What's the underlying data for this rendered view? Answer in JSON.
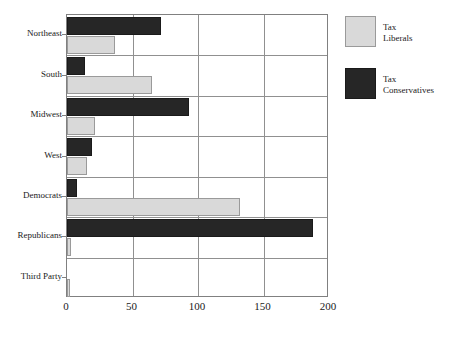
{
  "chart_data": {
    "type": "bar",
    "orientation": "horizontal",
    "title": "",
    "xlabel": "",
    "ylabel": "",
    "xlim": [
      0,
      200
    ],
    "ylim": null,
    "grid": true,
    "legend_position": "right",
    "xticks": [
      "0",
      "50",
      "100",
      "150",
      "200"
    ],
    "xtick_values": [
      0,
      50,
      100,
      150,
      200
    ],
    "categories": [
      "Northeast",
      "South",
      "Midwest",
      "West",
      "Democrats",
      "Republicans",
      "Third Party"
    ],
    "series": [
      {
        "name": "Tax Liberals",
        "color": "#d9d9d9",
        "values": [
          37,
          65,
          21,
          15,
          132,
          3,
          2
        ]
      },
      {
        "name": "Tax Conservatives",
        "color": "#262626",
        "values": [
          72,
          14,
          93,
          19,
          8,
          188,
          0
        ]
      }
    ]
  },
  "legend": {
    "entries": [
      {
        "label_line1": "Tax",
        "label_line2": "Liberals",
        "swatch": "light-swatch"
      },
      {
        "label_line1": "Tax",
        "label_line2": "Conservatives",
        "swatch": "dark-swatch"
      }
    ]
  },
  "colors": {
    "tax_liberals": "#d9d9d9",
    "tax_conservatives": "#262626",
    "axis": "#808080",
    "grid": "#909090",
    "text": "#1a1a1a",
    "background": "#ffffff"
  }
}
